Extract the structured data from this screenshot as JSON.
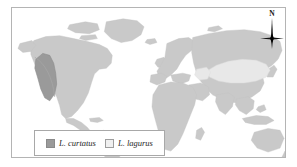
{
  "figure": {
    "type": "distribution-map",
    "background_color": "#ffffff",
    "frame_color": "#b4b4b4"
  },
  "map": {
    "projection": "world",
    "ocean_color": "#ffffff",
    "land_color": "#c9c9c9",
    "land_outline_color": "#bdbdbd",
    "ranges": [
      {
        "species": "L. curtatus",
        "region": "western North America",
        "fill_color": "#9a9a9a",
        "outline_color": "#8d8d8d"
      },
      {
        "species": "L. lagurus",
        "region": "central Eurasia",
        "fill_color": "#e8e8e8",
        "outline_color": "#d5d5d5"
      }
    ]
  },
  "compass": {
    "label": "N",
    "icon": "compass-rose-icon",
    "color": "#1a1a1a"
  },
  "legend": {
    "border_color": "#a8a8a8",
    "background_color": "#ffffff",
    "entries": [
      {
        "label": "L. curtatus",
        "swatch_class": "curtatus",
        "swatch_color": "#9a9a9a"
      },
      {
        "label": "L. lagurus",
        "swatch_class": "lagurus",
        "swatch_color": "#f0f0f0"
      }
    ]
  }
}
